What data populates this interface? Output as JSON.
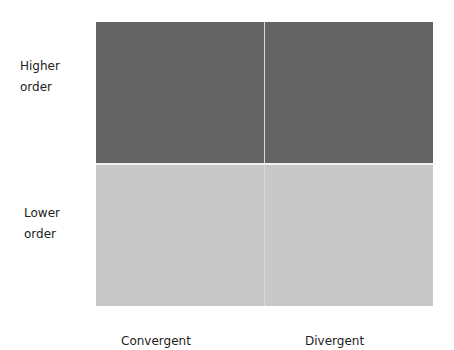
{
  "rows": [
    {
      "label_line1": "Higher",
      "label_line2": "order",
      "color": "#646464"
    },
    {
      "label_line1": "Lower",
      "label_line2": "order",
      "color": "#c8c8c8"
    }
  ],
  "columns": [
    {
      "label": "Convergent"
    },
    {
      "label": "Divergent"
    }
  ]
}
